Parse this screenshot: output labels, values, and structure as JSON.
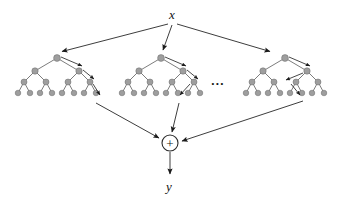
{
  "diagram": {
    "type": "tree-ensemble-diagram",
    "background_color": "#ffffff",
    "labels": {
      "input": "x",
      "output": "y",
      "combiner": "+",
      "ellipsis": "..."
    },
    "colors": {
      "node_fill": "#9e9e9e",
      "node_stroke": "#6b6b6b",
      "edge": "#5a5a5a",
      "arrow": "#1a1a1a",
      "text": "#111111",
      "combiner_fill": "#ffffff",
      "combiner_stroke": "#2a2a2a"
    },
    "input_node": {
      "label": "x",
      "x": 172,
      "y": 18
    },
    "output_node": {
      "label": "y",
      "x": 168,
      "y": 188
    },
    "combiner_node": {
      "label": "+",
      "cx": 170,
      "cy": 143,
      "r": 8
    },
    "trees": [
      {
        "name": "tree-1",
        "root_x": 57,
        "root_y": 58,
        "depth": 4,
        "leaf_count": 8,
        "node_counts": [
          1,
          2,
          4,
          8
        ],
        "decision_path": "root-right-right-right"
      },
      {
        "name": "tree-2",
        "root_x": 161,
        "root_y": 58,
        "depth": 4,
        "leaf_count": 8,
        "node_counts": [
          1,
          2,
          4,
          8
        ],
        "decision_path": "root-right-right-left"
      },
      {
        "name": "tree-3",
        "root_x": 285,
        "root_y": 58,
        "depth": 4,
        "leaf_count": 8,
        "node_counts": [
          1,
          2,
          4,
          8
        ],
        "decision_path": "root-right-left-right"
      }
    ],
    "input_arrows": [
      {
        "name": "x-to-tree-1",
        "from": [
          168,
          24
        ],
        "to": [
          60,
          52
        ]
      },
      {
        "name": "x-to-tree-2",
        "from": [
          172,
          25
        ],
        "to": [
          163,
          51
        ]
      },
      {
        "name": "x-to-tree-3",
        "from": [
          177,
          24
        ],
        "to": [
          272,
          52
        ]
      }
    ],
    "output_arrows": [
      {
        "name": "tree-1-to-sum",
        "from": [
          96,
          103
        ],
        "to": [
          160,
          139
        ]
      },
      {
        "name": "tree-2-to-sum",
        "from": [
          178,
          103
        ],
        "to": [
          172,
          133
        ]
      },
      {
        "name": "tree-3-to-sum",
        "from": [
          302,
          101
        ],
        "to": [
          181,
          141
        ]
      },
      {
        "name": "sum-to-y",
        "from": [
          170,
          152
        ],
        "to": [
          170,
          176
        ]
      }
    ],
    "ellipsis_position": {
      "x": 218,
      "y": 82
    }
  }
}
